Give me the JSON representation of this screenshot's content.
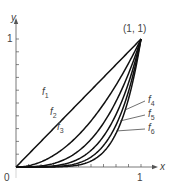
{
  "chart_data": {
    "type": "line",
    "title": "",
    "xlabel": "x",
    "ylabel": "y",
    "xlim": [
      0,
      1
    ],
    "ylim": [
      0,
      1
    ],
    "x_ticks": [
      0,
      0.1,
      0.2,
      0.3,
      0.4,
      0.5,
      0.6,
      0.7,
      0.8,
      0.9,
      1
    ],
    "y_ticks": [
      0,
      0.1,
      0.2,
      0.3,
      0.4,
      0.5,
      0.6,
      0.7,
      0.8,
      0.9,
      1
    ],
    "tick_labels": {
      "origin": "0",
      "x_one": "1",
      "y_one": "1"
    },
    "grid": false,
    "annotation": "(1, 1)",
    "series": [
      {
        "name": "f1",
        "exponent": 1,
        "label": "f",
        "sub": "1"
      },
      {
        "name": "f2",
        "exponent": 2,
        "label": "f",
        "sub": "2"
      },
      {
        "name": "f3",
        "exponent": 3,
        "label": "f",
        "sub": "3"
      },
      {
        "name": "f4",
        "exponent": 4,
        "label": "f",
        "sub": "4"
      },
      {
        "name": "f5",
        "exponent": 5,
        "label": "f",
        "sub": "5"
      },
      {
        "name": "f6",
        "exponent": 6,
        "label": "f",
        "sub": "6"
      }
    ],
    "formula": "f_n(x) = x^n"
  },
  "colors": {
    "curve": "#111111",
    "axis": "#555555",
    "text": "#444444"
  }
}
